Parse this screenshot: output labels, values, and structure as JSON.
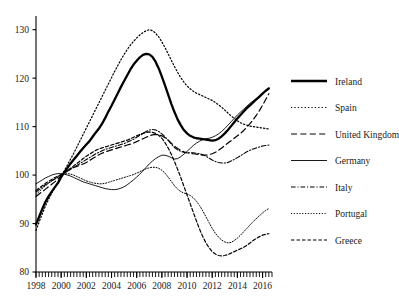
{
  "chart_data": {
    "type": "line",
    "title": "",
    "subtitle": "",
    "xlabel": "",
    "ylabel": "",
    "xlim": [
      1998,
      2016.75
    ],
    "ylim": [
      80,
      132
    ],
    "yticks": [
      80,
      90,
      100,
      110,
      120,
      130
    ],
    "xticks": [
      1998,
      2000,
      2002,
      2004,
      2006,
      2008,
      2010,
      2012,
      2014,
      2016
    ],
    "minor_tick_interval": 0.25,
    "grid": false,
    "legend_position": "right",
    "x": [
      1998,
      1998.25,
      1998.5,
      1998.75,
      1999,
      1999.25,
      1999.5,
      1999.75,
      2000,
      2000.25,
      2000.5,
      2000.75,
      2001,
      2001.25,
      2001.5,
      2001.75,
      2002,
      2002.25,
      2002.5,
      2002.75,
      2003,
      2003.25,
      2003.5,
      2003.75,
      2004,
      2004.25,
      2004.5,
      2004.75,
      2005,
      2005.25,
      2005.5,
      2005.75,
      2006,
      2006.25,
      2006.5,
      2006.75,
      2007,
      2007.25,
      2007.5,
      2007.75,
      2008,
      2008.25,
      2008.5,
      2008.75,
      2009,
      2009.25,
      2009.5,
      2009.75,
      2010,
      2010.25,
      2010.5,
      2010.75,
      2011,
      2011.25,
      2011.5,
      2011.75,
      2012,
      2012.25,
      2012.5,
      2012.75,
      2013,
      2013.25,
      2013.5,
      2013.75,
      2014,
      2014.25,
      2014.5,
      2014.75,
      2015,
      2015.25,
      2015.5,
      2015.75,
      2016,
      2016.25,
      2016.5
    ],
    "series": [
      {
        "name": "Ireland",
        "style": "solid-thick",
        "values": [
          89.8,
          91.4,
          93.0,
          94.5,
          95.6,
          96.6,
          97.5,
          98.4,
          99.6,
          100.6,
          101.5,
          102.4,
          103.2,
          104.0,
          104.8,
          105.6,
          106.3,
          107.0,
          107.9,
          108.8,
          109.6,
          110.6,
          111.8,
          113.1,
          114.3,
          115.6,
          116.9,
          118.2,
          119.4,
          120.6,
          121.8,
          122.8,
          123.6,
          124.3,
          124.8,
          125.0,
          124.9,
          124.4,
          123.4,
          122.0,
          120.3,
          118.5,
          116.6,
          114.7,
          113.0,
          111.5,
          110.3,
          109.3,
          108.6,
          108.1,
          107.8,
          107.6,
          107.5,
          107.4,
          107.3,
          107.2,
          107.1,
          107.2,
          107.5,
          108.0,
          108.6,
          109.3,
          110.1,
          110.9,
          111.7,
          112.4,
          113.1,
          113.8,
          114.4,
          115.0,
          115.6,
          116.2,
          116.8,
          117.4,
          117.9
        ]
      },
      {
        "name": "Spain",
        "style": "dotted",
        "values": [
          88.6,
          90.3,
          92.0,
          93.6,
          95.0,
          96.3,
          97.4,
          98.5,
          99.7,
          100.9,
          102.1,
          103.3,
          104.5,
          105.8,
          107.1,
          108.4,
          109.7,
          111.0,
          112.3,
          113.6,
          114.9,
          116.2,
          117.5,
          118.8,
          120.1,
          121.4,
          122.6,
          123.8,
          124.9,
          125.9,
          126.8,
          127.6,
          128.3,
          128.9,
          129.4,
          129.8,
          130.0,
          129.8,
          129.3,
          128.5,
          127.5,
          126.3,
          125.0,
          123.7,
          122.4,
          121.2,
          120.1,
          119.2,
          118.4,
          117.8,
          117.3,
          116.9,
          116.6,
          116.3,
          116.0,
          115.7,
          115.4,
          115.0,
          114.5,
          114.0,
          113.4,
          112.8,
          112.2,
          111.7,
          111.2,
          110.8,
          110.5,
          110.3,
          110.1,
          110.0,
          109.9,
          109.8,
          109.7,
          109.6,
          109.5
        ]
      },
      {
        "name": "United Kingdom",
        "style": "dashed-long",
        "values": [
          95.6,
          96.1,
          96.6,
          97.1,
          97.6,
          98.1,
          98.6,
          99.2,
          99.8,
          100.4,
          100.9,
          101.3,
          101.6,
          101.8,
          102.0,
          102.3,
          102.6,
          103.0,
          103.4,
          103.8,
          104.2,
          104.5,
          104.8,
          105.0,
          105.2,
          105.4,
          105.6,
          105.8,
          106.0,
          106.2,
          106.4,
          106.6,
          106.9,
          107.2,
          107.5,
          107.8,
          108.1,
          108.3,
          108.4,
          108.3,
          108.1,
          107.7,
          107.2,
          106.6,
          106.0,
          105.5,
          105.1,
          104.8,
          104.6,
          104.5,
          104.4,
          104.3,
          104.2,
          104.1,
          104.1,
          104.2,
          104.4,
          104.7,
          105.1,
          105.6,
          106.1,
          106.6,
          107.1,
          107.6,
          108.1,
          108.6,
          109.2,
          109.9,
          110.6,
          111.4,
          112.3,
          113.3,
          114.4,
          115.6,
          116.8
        ]
      },
      {
        "name": "Germany",
        "style": "solid-thin",
        "values": [
          98.2,
          98.6,
          99.0,
          99.4,
          99.7,
          100.0,
          100.2,
          100.3,
          100.3,
          100.2,
          100.0,
          99.8,
          99.5,
          99.2,
          98.9,
          98.6,
          98.4,
          98.2,
          98.0,
          97.8,
          97.6,
          97.4,
          97.2,
          97.1,
          97.0,
          97.0,
          97.1,
          97.3,
          97.6,
          98.0,
          98.5,
          99.0,
          99.6,
          100.2,
          100.9,
          101.6,
          102.3,
          102.9,
          103.4,
          103.8,
          104.1,
          104.1,
          103.9,
          103.6,
          103.3,
          103.4,
          103.8,
          104.3,
          104.9,
          105.5,
          106.1,
          106.6,
          107.0,
          107.3,
          107.5,
          107.6,
          107.8,
          108.1,
          108.5,
          109.0,
          109.6,
          110.3,
          111.0,
          111.7,
          112.4,
          113.0,
          113.6,
          114.2,
          114.8,
          115.3,
          115.8,
          116.3,
          116.8,
          117.3,
          117.7
        ]
      },
      {
        "name": "Italy",
        "style": "dash-dot",
        "values": [
          96.5,
          97.0,
          97.5,
          98.0,
          98.4,
          98.8,
          99.2,
          99.6,
          100.0,
          100.4,
          100.8,
          101.2,
          101.6,
          102.0,
          102.4,
          102.8,
          103.2,
          103.6,
          104.0,
          104.4,
          104.7,
          105.0,
          105.3,
          105.5,
          105.7,
          105.9,
          106.1,
          106.3,
          106.5,
          106.8,
          107.1,
          107.4,
          107.8,
          108.2,
          108.6,
          109.0,
          109.3,
          109.4,
          109.3,
          109.0,
          108.5,
          107.9,
          107.2,
          106.4,
          105.7,
          105.2,
          104.9,
          104.7,
          104.6,
          104.6,
          104.6,
          104.5,
          104.4,
          104.2,
          103.9,
          103.5,
          103.1,
          102.8,
          102.6,
          102.5,
          102.5,
          102.6,
          102.9,
          103.2,
          103.6,
          104.0,
          104.4,
          104.8,
          105.1,
          105.4,
          105.6,
          105.8,
          106.0,
          106.1,
          106.2
        ]
      },
      {
        "name": "Portugal",
        "style": "dotted-fine",
        "values": [
          96.0,
          96.6,
          97.2,
          97.8,
          98.3,
          98.8,
          99.2,
          99.6,
          100.0,
          100.2,
          100.3,
          100.2,
          100.0,
          99.7,
          99.4,
          99.1,
          98.8,
          98.6,
          98.4,
          98.3,
          98.2,
          98.2,
          98.3,
          98.5,
          98.7,
          98.9,
          99.1,
          99.3,
          99.5,
          99.7,
          99.9,
          100.1,
          100.4,
          100.7,
          101.0,
          101.3,
          101.5,
          101.6,
          101.6,
          101.4,
          101.0,
          100.4,
          99.6,
          98.7,
          97.8,
          97.1,
          96.6,
          96.3,
          96.1,
          95.8,
          95.3,
          94.6,
          93.7,
          92.6,
          91.4,
          90.2,
          89.0,
          88.0,
          87.2,
          86.6,
          86.2,
          86.0,
          86.1,
          86.5,
          87.0,
          87.6,
          88.3,
          89.0,
          89.7,
          90.4,
          91.0,
          91.6,
          92.2,
          92.7,
          93.1
        ]
      },
      {
        "name": "Greece",
        "style": "dashed-short",
        "values": [
          96.8,
          97.3,
          97.8,
          98.3,
          98.7,
          99.1,
          99.5,
          99.8,
          100.1,
          100.5,
          100.9,
          101.4,
          101.9,
          102.4,
          102.9,
          103.4,
          103.9,
          104.3,
          104.7,
          105.1,
          105.4,
          105.6,
          105.8,
          106.0,
          106.2,
          106.4,
          106.6,
          106.8,
          107.0,
          107.2,
          107.5,
          107.8,
          108.1,
          108.4,
          108.6,
          108.8,
          108.9,
          108.8,
          108.6,
          108.2,
          107.6,
          106.7,
          105.6,
          104.3,
          102.8,
          101.2,
          99.5,
          97.7,
          95.9,
          94.1,
          92.3,
          90.5,
          88.8,
          87.3,
          86.0,
          85.0,
          84.2,
          83.7,
          83.4,
          83.3,
          83.4,
          83.6,
          83.9,
          84.2,
          84.5,
          84.8,
          85.1,
          85.5,
          86.0,
          86.5,
          86.9,
          87.3,
          87.6,
          87.8,
          87.9
        ]
      }
    ]
  },
  "legend": {
    "items": [
      {
        "label": "Ireland"
      },
      {
        "label": "Spain"
      },
      {
        "label": "United Kingdom"
      },
      {
        "label": "Germany"
      },
      {
        "label": "Italy"
      },
      {
        "label": "Portugal"
      },
      {
        "label": "Greece"
      }
    ]
  },
  "axes": {
    "y_tick_labels": [
      "130",
      "120",
      "110",
      "100",
      "90",
      "80"
    ],
    "x_tick_labels": [
      "1998",
      "2000",
      "2002",
      "2004",
      "2006",
      "2008",
      "2010",
      "2012",
      "2014",
      "2016"
    ]
  },
  "colors": {
    "line": "#000000",
    "axis": "#000000",
    "background": "#ffffff"
  }
}
